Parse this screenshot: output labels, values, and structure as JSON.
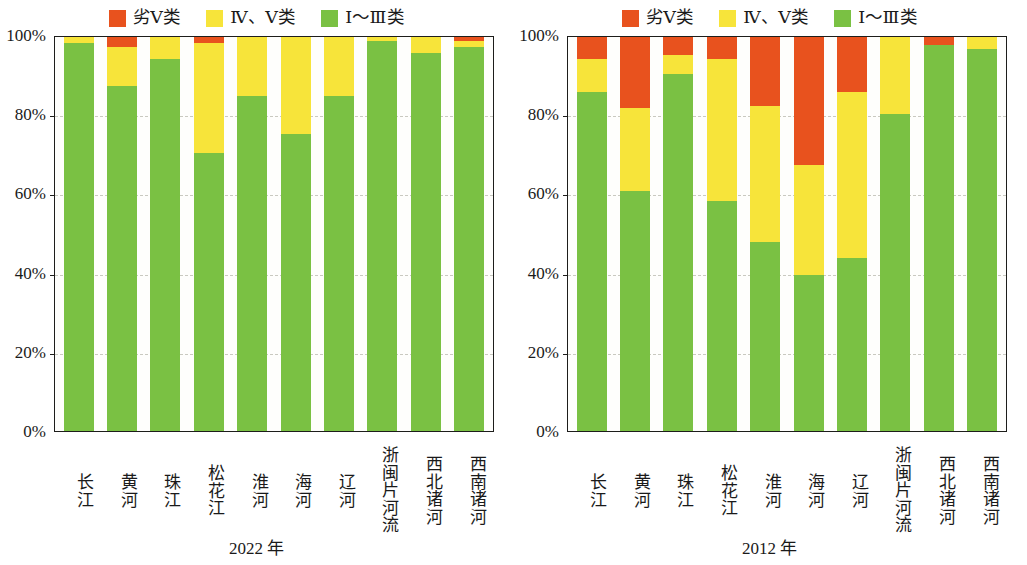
{
  "legend": {
    "items": [
      {
        "label": "劣Ⅴ类",
        "color": "#e8521e",
        "key": "bad",
        "icon": "legend-swatch-bad"
      },
      {
        "label": "Ⅳ、Ⅴ类",
        "color": "#f7e43a",
        "key": "mid",
        "icon": "legend-swatch-mid"
      },
      {
        "label": "Ⅰ～Ⅲ类",
        "color": "#7ac143",
        "key": "good",
        "icon": "legend-swatch-good"
      }
    ]
  },
  "yticks": [
    "100%",
    "80%",
    "60%",
    "40%",
    "20%",
    "0%"
  ],
  "panels": [
    {
      "caption": "2022 年"
    },
    {
      "caption": "2012 年"
    }
  ],
  "chart_data": [
    {
      "type": "bar",
      "title": "2022 年",
      "stacked": true,
      "percent": true,
      "xlabel": "",
      "ylabel": "",
      "ylim": [
        0,
        100
      ],
      "yticks": [
        0,
        20,
        40,
        60,
        80,
        100
      ],
      "grid": "horizontal-dashed",
      "legend_position": "top-center",
      "categories": [
        "长江",
        "黄河",
        "珠江",
        "松花江",
        "淮河",
        "海河",
        "辽河",
        "浙闽片河流",
        "西北诸河",
        "西南诸河"
      ],
      "series": [
        {
          "name": "Ⅰ～Ⅲ类",
          "color": "#7ac143",
          "values": [
            98.5,
            87.5,
            94.5,
            70.5,
            85.0,
            75.5,
            85.0,
            99.0,
            96.0,
            97.5
          ]
        },
        {
          "name": "Ⅳ、Ⅴ类",
          "color": "#f7e43a",
          "values": [
            1.5,
            10.0,
            5.5,
            28.0,
            15.0,
            24.5,
            15.0,
            1.0,
            4.0,
            1.5
          ]
        },
        {
          "name": "劣Ⅴ类",
          "color": "#e8521e",
          "values": [
            0.0,
            2.5,
            0.0,
            1.5,
            0.0,
            0.0,
            0.0,
            0.0,
            0.0,
            1.0
          ]
        }
      ]
    },
    {
      "type": "bar",
      "title": "2012 年",
      "stacked": true,
      "percent": true,
      "xlabel": "",
      "ylabel": "",
      "ylim": [
        0,
        100
      ],
      "yticks": [
        0,
        20,
        40,
        60,
        80,
        100
      ],
      "grid": "horizontal-dashed",
      "legend_position": "top-center",
      "categories": [
        "长江",
        "黄河",
        "珠江",
        "松花江",
        "淮河",
        "海河",
        "辽河",
        "浙闽片河流",
        "西北诸河",
        "西南诸河"
      ],
      "series": [
        {
          "name": "Ⅰ～Ⅲ类",
          "color": "#7ac143",
          "values": [
            86.0,
            61.0,
            90.5,
            58.5,
            48.0,
            39.5,
            44.0,
            80.5,
            98.0,
            97.0
          ]
        },
        {
          "name": "Ⅳ、Ⅴ类",
          "color": "#f7e43a",
          "values": [
            8.5,
            21.0,
            5.0,
            36.0,
            34.5,
            28.0,
            42.0,
            19.5,
            0.0,
            3.0
          ]
        },
        {
          "name": "劣Ⅴ类",
          "color": "#e8521e",
          "values": [
            5.5,
            18.0,
            4.5,
            5.5,
            17.5,
            32.5,
            14.0,
            0.0,
            2.0,
            0.0
          ]
        }
      ]
    }
  ]
}
